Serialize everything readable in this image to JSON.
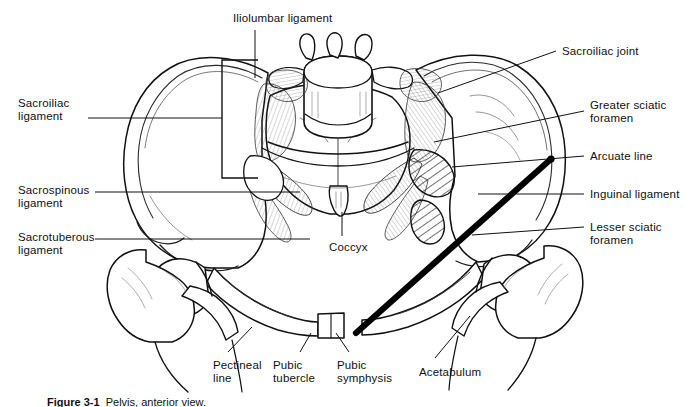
{
  "figure": {
    "background_color": "#ffffff",
    "ink_color": "#111111",
    "caption": "Figure 3-1",
    "caption_rest": "  Pelvis, anterior view."
  },
  "labels": [
    {
      "id": "iliolumbar-ligament",
      "text": "Iliolumbar ligament",
      "lines": [
        "Iliolumbar ligament"
      ],
      "side": "top",
      "x": 233,
      "y": 12
    },
    {
      "id": "sacroiliac-joint",
      "text": "Sacroiliac joint",
      "lines": [
        "Sacroiliac joint"
      ],
      "side": "right",
      "x": 562,
      "y": 45
    },
    {
      "id": "sacroiliac-ligament",
      "text": "Sacroiliac ligament",
      "lines": [
        "Sacroiliac",
        "ligament"
      ],
      "side": "left",
      "x": 18,
      "y": 97
    },
    {
      "id": "greater-sciatic-foramen",
      "text": "Greater sciatic foramen",
      "lines": [
        "Greater sciatic",
        "foramen"
      ],
      "side": "right",
      "x": 590,
      "y": 99
    },
    {
      "id": "arcuate-line",
      "text": "Arcuate line",
      "lines": [
        "Arcuate line"
      ],
      "side": "right",
      "x": 590,
      "y": 150
    },
    {
      "id": "sacrospinous-ligament",
      "text": "Sacrospinous ligament",
      "lines": [
        "Sacrospinous",
        "ligament"
      ],
      "side": "left",
      "x": 18,
      "y": 184
    },
    {
      "id": "inguinal-ligament",
      "text": "Inguinal ligament",
      "lines": [
        "Inguinal ligament"
      ],
      "side": "right",
      "x": 590,
      "y": 188
    },
    {
      "id": "sacrotuberous-ligament",
      "text": "Sacrotuberous ligament",
      "lines": [
        "Sacrotuberous",
        "ligament"
      ],
      "side": "left",
      "x": 18,
      "y": 231
    },
    {
      "id": "lesser-sciatic-foramen",
      "text": "Lesser sciatic foramen",
      "lines": [
        "Lesser sciatic",
        "foramen"
      ],
      "side": "right",
      "x": 590,
      "y": 221
    },
    {
      "id": "coccyx",
      "text": "Coccyx",
      "lines": [
        "Coccyx"
      ],
      "side": "center",
      "x": 329,
      "y": 241
    },
    {
      "id": "pectineal-line",
      "text": "Pectineal line",
      "lines": [
        "Pectineal",
        "line"
      ],
      "side": "bottom",
      "x": 213,
      "y": 359
    },
    {
      "id": "pubic-tubercle",
      "text": "Pubic tubercle",
      "lines": [
        "Pubic",
        "tubercle"
      ],
      "side": "bottom",
      "x": 273,
      "y": 359
    },
    {
      "id": "pubic-symphysis",
      "text": "Pubic symphysis",
      "lines": [
        "Pubic",
        "symphysis"
      ],
      "side": "bottom",
      "x": 337,
      "y": 359
    },
    {
      "id": "acetabulum",
      "text": "Acetabulum",
      "lines": [
        "Acetabulum"
      ],
      "side": "bottom",
      "x": 419,
      "y": 366
    }
  ],
  "leader_lines": [
    {
      "id": "leader-iliolumbar-ligament",
      "from": [
        255,
        30
      ],
      "to": [
        255,
        78
      ]
    },
    {
      "id": "leader-sacroiliac-joint",
      "from": [
        556,
        51
      ],
      "to": [
        438,
        93
      ]
    },
    {
      "id": "leader-sacroiliac-ligament",
      "from": [
        88,
        118
      ],
      "to": [
        258,
        118
      ]
    },
    {
      "id": "leader-greater-sciatic-foramen",
      "from": [
        584,
        111
      ],
      "to": [
        434,
        142
      ]
    },
    {
      "id": "leader-arcuate-line",
      "from": [
        584,
        156
      ],
      "to": [
        452,
        167
      ]
    },
    {
      "id": "leader-sacrospinous-ligament",
      "from": [
        95,
        192
      ],
      "to": [
        300,
        192
      ]
    },
    {
      "id": "leader-inguinal-ligament",
      "from": [
        584,
        194
      ],
      "to": [
        478,
        194
      ]
    },
    {
      "id": "leader-sacrotuberous-ligament",
      "from": [
        95,
        239
      ],
      "to": [
        310,
        239
      ]
    },
    {
      "id": "leader-lesser-sciatic-foramen",
      "from": [
        584,
        227
      ],
      "to": [
        472,
        235
      ]
    },
    {
      "id": "leader-coccyx",
      "from": [
        342,
        236
      ],
      "to": [
        342,
        212
      ]
    },
    {
      "id": "leader-pectineal-line",
      "from": [
        228,
        352
      ],
      "to": [
        252,
        327
      ]
    },
    {
      "id": "leader-pubic-tubercle",
      "from": [
        300,
        352
      ],
      "to": [
        311,
        333
      ]
    },
    {
      "id": "leader-pubic-symphysis",
      "from": [
        349,
        352
      ],
      "to": [
        336,
        333
      ]
    },
    {
      "id": "leader-acetabulum",
      "from": [
        435,
        358
      ],
      "to": [
        470,
        316
      ]
    }
  ],
  "structures": {
    "left_ilium": "iliac wing, left",
    "right_ilium": "iliac wing, right",
    "sacrum": "sacrum",
    "vertebra": "L5 vertebral body",
    "coccyx": "coccyx",
    "pubic_rami": "superior and inferior pubic rami",
    "femur_left": "left femoral head and greater trochanter",
    "femur_right": "right femoral head and greater trochanter",
    "inguinal_ligament_band": "thick black diagonal band",
    "greater_sciatic_foramen_hatch": "hatched region upper",
    "lesser_sciatic_foramen_hatch": "hatched region lower",
    "bracket": "sacroiliac ligament bracket"
  }
}
